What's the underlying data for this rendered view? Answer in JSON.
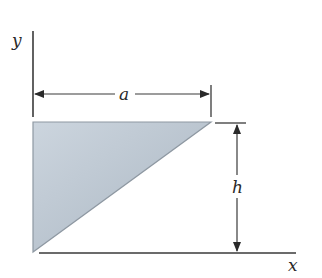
{
  "diagram": {
    "type": "geometry-figure",
    "labels": {
      "y_axis": "y",
      "x_axis": "x",
      "width_dim": "a",
      "height_dim": "h"
    },
    "colors": {
      "fill_light": "#ccd5de",
      "fill_dark": "#aab6c2",
      "edge": "#8e98a2",
      "line": "#3a3a3a"
    },
    "geometry": {
      "origin": [
        33,
        252
      ],
      "top_left": [
        33,
        122
      ],
      "top_right": [
        211,
        122
      ]
    }
  }
}
